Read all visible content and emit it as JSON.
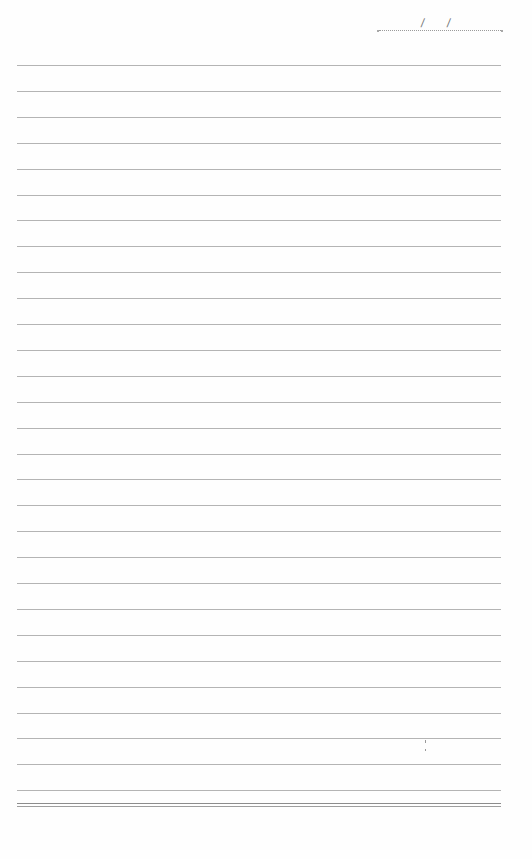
{
  "page": {
    "type": "lined-notebook-page",
    "background": "#fefefe",
    "rule_color": "#b4b4b4",
    "date_field": {
      "separator": "/",
      "separators": [
        "/",
        "/"
      ]
    },
    "ruled_lines": {
      "count": 29,
      "first_y": 65,
      "spacing": 25.9,
      "left": 17,
      "width": 484
    },
    "bottom_double_rule": {
      "y1": 803,
      "y2": 805
    },
    "marks": [
      {
        "x": 425,
        "y": 740,
        "height": 3
      },
      {
        "x": 425,
        "y": 749,
        "height": 2
      }
    ]
  }
}
